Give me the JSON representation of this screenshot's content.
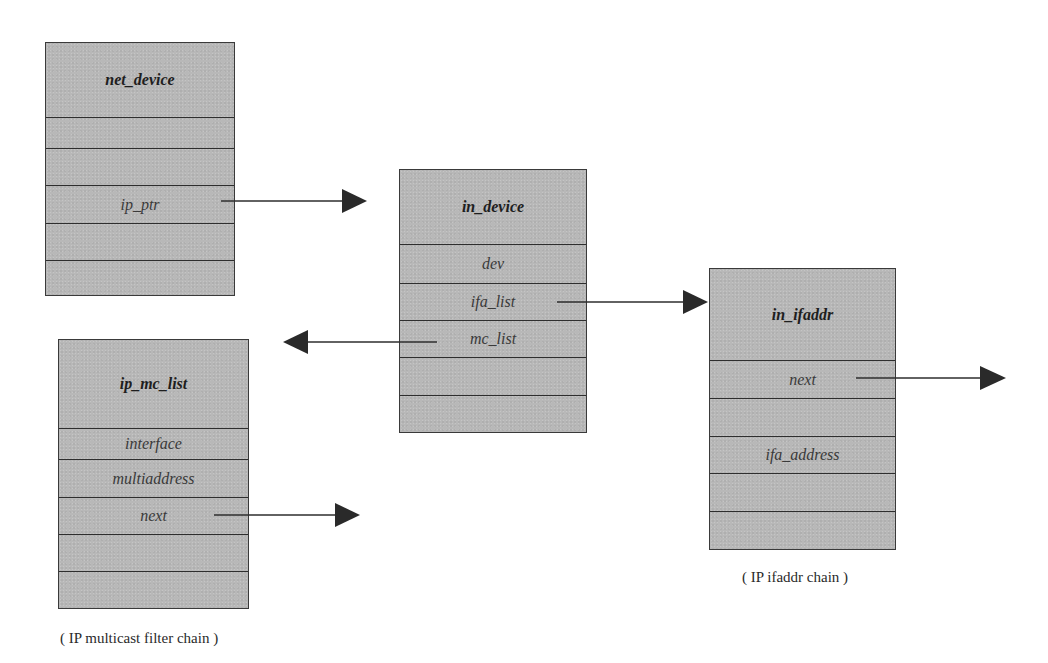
{
  "structs": {
    "net_device": {
      "title": "net_device",
      "fields": [
        "",
        "",
        "ip_ptr",
        "",
        ""
      ]
    },
    "in_device": {
      "title": "in_device",
      "fields": [
        "dev",
        "ifa_list",
        "mc_list",
        "",
        ""
      ]
    },
    "in_ifaddr": {
      "title": "in_ifaddr",
      "fields": [
        "next",
        "",
        "ifa_address",
        "",
        ""
      ]
    },
    "ip_mc_list": {
      "title": "ip_mc_list",
      "fields": [
        "interface",
        "multiaddress",
        "next",
        "",
        ""
      ]
    }
  },
  "arrows": [
    {
      "from": "net_device.ip_ptr",
      "to": "in_device",
      "direction": "right"
    },
    {
      "from": "in_device.ifa_list",
      "to": "in_ifaddr",
      "direction": "right"
    },
    {
      "from": "in_device.mc_list",
      "to": "ip_mc_list",
      "direction": "left"
    },
    {
      "from": "in_ifaddr.next",
      "to": "next in_ifaddr",
      "direction": "right"
    },
    {
      "from": "ip_mc_list.next",
      "to": "next ip_mc_list",
      "direction": "right"
    }
  ],
  "captions": {
    "ifaddr_chain": "( IP ifaddr chain )",
    "multicast_chain": "( IP multicast filter chain )"
  },
  "colors": {
    "box_fill": "#b8b8b8",
    "line": "#2e2e2e",
    "arrowhead": "#2a2a2a"
  }
}
